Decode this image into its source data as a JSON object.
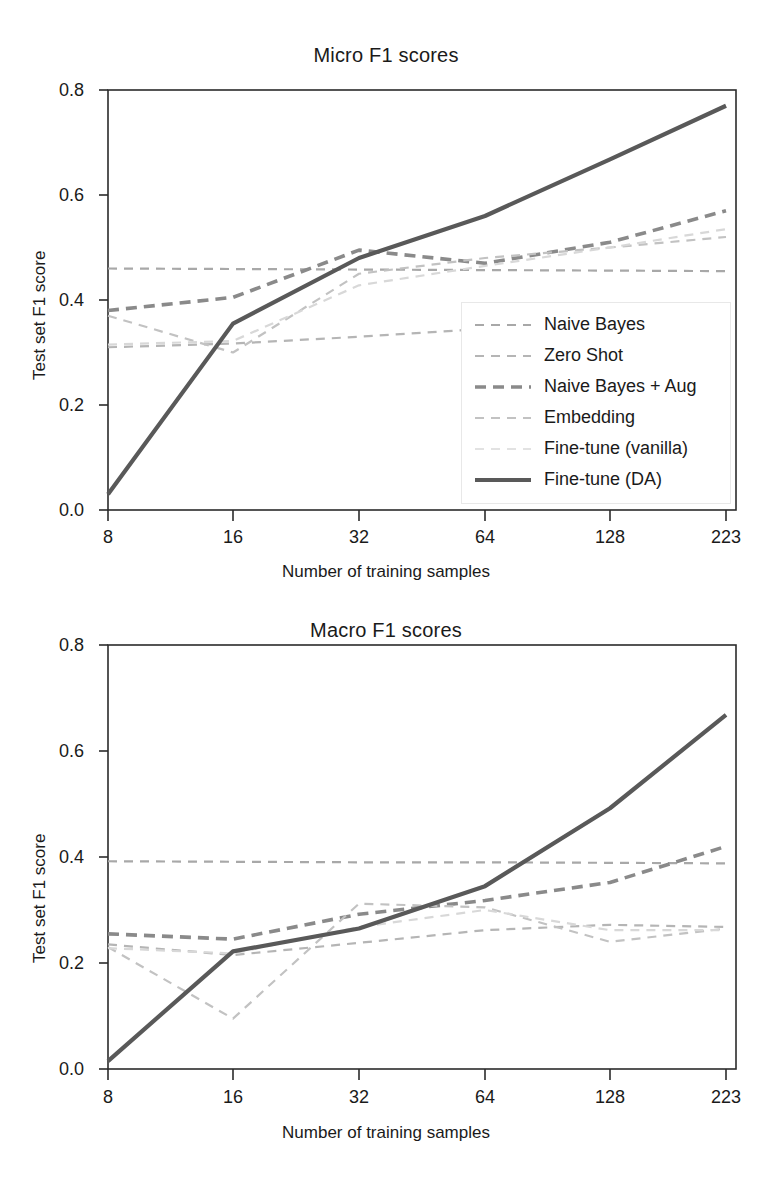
{
  "figure": {
    "xlabel": "Number of training samples",
    "ylabel": "Test set F1 score"
  },
  "legend": {
    "items": [
      {
        "label": "Naive Bayes",
        "color": "#a8a8a8",
        "width": 2.2,
        "dash": "9,7"
      },
      {
        "label": "Zero Shot",
        "color": "#b5b5b5",
        "width": 2.2,
        "dash": "9,7"
      },
      {
        "label": "Naive Bayes + Aug",
        "color": "#8a8a8a",
        "width": 3.6,
        "dash": "11,7"
      },
      {
        "label": "Embedding",
        "color": "#c2c2c2",
        "width": 2.2,
        "dash": "9,7"
      },
      {
        "label": "Fine-tune (vanilla)",
        "color": "#d8d8d8",
        "width": 2.2,
        "dash": "9,7"
      },
      {
        "label": "Fine-tune (DA)",
        "color": "#595959",
        "width": 4.2,
        "dash": "none"
      }
    ]
  },
  "chart_data": [
    {
      "type": "line",
      "title": "Micro F1 scores",
      "xlabel": "Number of training samples",
      "ylabel": "Test set F1 score",
      "categories": [
        "8",
        "16",
        "32",
        "64",
        "128",
        "223"
      ],
      "x": [
        8,
        16,
        32,
        64,
        128,
        223
      ],
      "xscale": "categorical (log-spaced ticks)",
      "ylim": [
        0.0,
        0.8
      ],
      "yticks": [
        0.0,
        0.2,
        0.4,
        0.6,
        0.8
      ],
      "ytick_labels": [
        "0.0",
        "0.2",
        "0.4",
        "0.6",
        "0.8"
      ],
      "grid": false,
      "legend_position": "lower right (inside axes)",
      "series": [
        {
          "name": "Naive Bayes",
          "values": [
            0.46,
            0.459,
            0.458,
            0.457,
            0.456,
            0.455
          ]
        },
        {
          "name": "Zero Shot",
          "values": [
            0.31,
            0.317,
            0.33,
            0.345,
            0.352,
            0.358
          ]
        },
        {
          "name": "Naive Bayes + Aug",
          "values": [
            0.38,
            0.405,
            0.495,
            0.47,
            0.51,
            0.57
          ]
        },
        {
          "name": "Embedding",
          "values": [
            0.37,
            0.3,
            0.45,
            0.48,
            0.5,
            0.52
          ]
        },
        {
          "name": "Fine-tune (vanilla)",
          "values": [
            0.315,
            0.322,
            0.428,
            0.465,
            0.5,
            0.535
          ]
        },
        {
          "name": "Fine-tune (DA)",
          "values": [
            0.03,
            0.355,
            0.48,
            0.56,
            0.668,
            0.77
          ]
        }
      ]
    },
    {
      "type": "line",
      "title": "Macro F1 scores",
      "xlabel": "Number of training samples",
      "ylabel": "Test set F1 score",
      "categories": [
        "8",
        "16",
        "32",
        "64",
        "128",
        "223"
      ],
      "x": [
        8,
        16,
        32,
        64,
        128,
        223
      ],
      "xscale": "categorical (log-spaced ticks)",
      "ylim": [
        0.0,
        0.8
      ],
      "yticks": [
        0.0,
        0.2,
        0.4,
        0.6,
        0.8
      ],
      "ytick_labels": [
        "0.0",
        "0.2",
        "0.4",
        "0.6",
        "0.8"
      ],
      "grid": false,
      "legend_position": "none (shared with top panel)",
      "series": [
        {
          "name": "Naive Bayes",
          "values": [
            0.392,
            0.391,
            0.39,
            0.39,
            0.389,
            0.388
          ]
        },
        {
          "name": "Zero Shot",
          "values": [
            0.235,
            0.215,
            0.238,
            0.262,
            0.272,
            0.268
          ]
        },
        {
          "name": "Naive Bayes + Aug",
          "values": [
            0.255,
            0.245,
            0.292,
            0.318,
            0.352,
            0.42
          ]
        },
        {
          "name": "Embedding",
          "values": [
            0.23,
            0.095,
            0.312,
            0.305,
            0.24,
            0.265
          ]
        },
        {
          "name": "Fine-tune (vanilla)",
          "values": [
            0.228,
            0.218,
            0.268,
            0.3,
            0.262,
            0.262
          ]
        },
        {
          "name": "Fine-tune (DA)",
          "values": [
            0.015,
            0.222,
            0.265,
            0.345,
            0.492,
            0.668
          ]
        }
      ]
    }
  ]
}
